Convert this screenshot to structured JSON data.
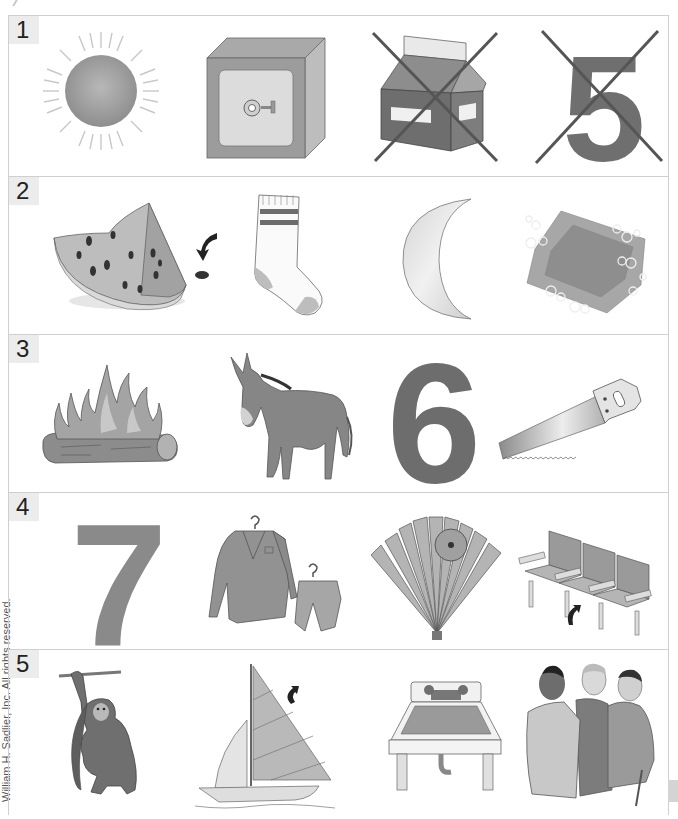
{
  "page": {
    "margin_credit": "William H. Sadlier, Inc. All rights reserved.",
    "colors": {
      "ink": "#222222",
      "gray_fill": "#8a8a8a",
      "dark_gray": "#6d6d6d",
      "border": "#cfcfcf",
      "label_bg": "#ececec"
    }
  },
  "rows": [
    {
      "number": "1",
      "items": [
        {
          "name": "sun",
          "crossed": false
        },
        {
          "name": "safe",
          "crossed": false
        },
        {
          "name": "milk carton",
          "crossed": true
        },
        {
          "name": "number 5",
          "label": "5",
          "crossed": true
        }
      ]
    },
    {
      "number": "2",
      "items": [
        {
          "name": "watermelon seed",
          "crossed": false
        },
        {
          "name": "sock",
          "crossed": false
        },
        {
          "name": "moon",
          "crossed": false
        },
        {
          "name": "soap",
          "crossed": false
        }
      ]
    },
    {
      "number": "3",
      "items": [
        {
          "name": "fire",
          "crossed": false
        },
        {
          "name": "mule",
          "crossed": false
        },
        {
          "name": "number 6",
          "label": "6",
          "crossed": false
        },
        {
          "name": "saw",
          "crossed": false
        }
      ]
    },
    {
      "number": "4",
      "items": [
        {
          "name": "number 7",
          "label": "7",
          "crossed": false
        },
        {
          "name": "suit",
          "crossed": false
        },
        {
          "name": "fan",
          "crossed": false
        },
        {
          "name": "seat",
          "crossed": false
        }
      ]
    },
    {
      "number": "5",
      "items": [
        {
          "name": "monkey",
          "crossed": false
        },
        {
          "name": "sail",
          "crossed": false
        },
        {
          "name": "sink",
          "crossed": false
        },
        {
          "name": "men",
          "crossed": false
        }
      ]
    }
  ]
}
